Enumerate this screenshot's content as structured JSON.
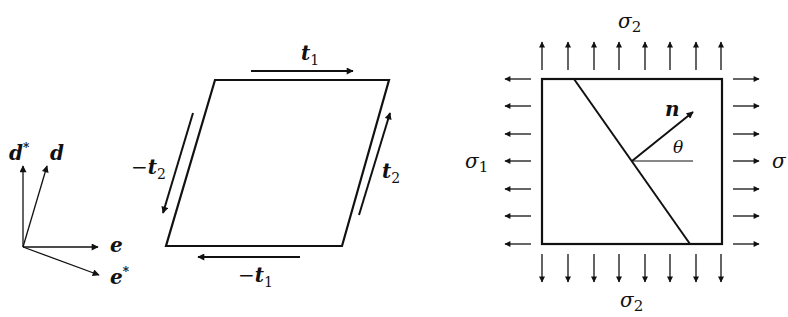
{
  "diagram": {
    "basis": {
      "labels": {
        "d_star": "d",
        "d_star_sup": "*",
        "d": "d",
        "e": "e",
        "e_star": "e",
        "e_star_sup": "*"
      }
    },
    "parallelogram": {
      "labels": {
        "t1_top": "t",
        "t1_top_sub": "1",
        "t1_bottom_minus": "−",
        "t1_bottom": "t",
        "t1_bottom_sub": "1",
        "t2_left_minus": "−",
        "t2_left": "t",
        "t2_left_sub": "2",
        "t2_right": "t",
        "t2_right_sub": "2"
      }
    },
    "stress_square": {
      "labels": {
        "sigma2_top": "σ",
        "sigma2_top_sub": "2",
        "sigma2_bottom": "σ",
        "sigma2_bottom_sub": "2",
        "sigma1_left": "σ",
        "sigma1_left_sub": "1",
        "sigma_right": "σ",
        "normal": "n",
        "angle": "θ"
      },
      "arrow_counts": {
        "top": 8,
        "bottom": 8,
        "left": 7,
        "right": 7
      }
    }
  }
}
